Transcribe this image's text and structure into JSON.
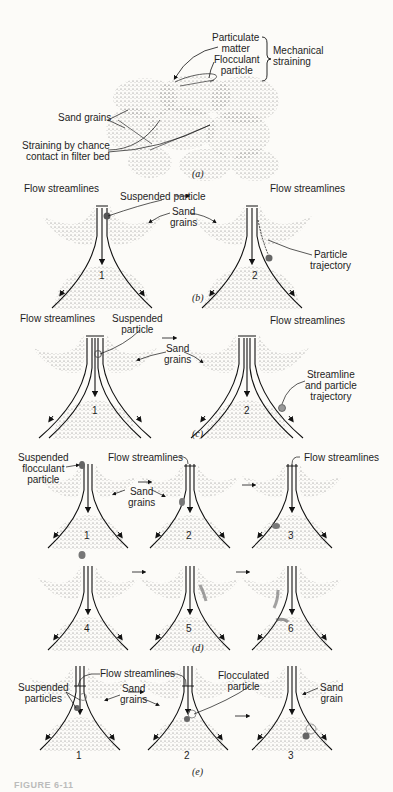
{
  "figure": {
    "caption_prefix": "FIGURE 6-11",
    "panels": {
      "a": {
        "caption": "(a)",
        "labels": {
          "particulate_matter": "Particulate\nmatter",
          "flocculant_particle": "Flocculant\nparticle",
          "mechanical_straining": "Mechanical\nstraining",
          "sand_grains": "Sand grains",
          "chance_contact": "Straining by chance\ncontact in filter bed"
        }
      },
      "b": {
        "caption": "(b)",
        "labels": {
          "flow_left": "Flow streamlines",
          "flow_right": "Flow streamlines",
          "suspended_particle": "Suspended particle",
          "sand_grains": "Sand\ngrains",
          "particle_trajectory": "Particle\ntrajectory"
        },
        "grain_numbers": [
          "1",
          "2"
        ]
      },
      "c": {
        "caption": "(c)",
        "labels": {
          "flow_left": "Flow streamlines",
          "flow_right": "Flow streamlines",
          "suspended_particle": "Suspended\nparticle",
          "sand_grains": "Sand\ngrains",
          "streamline_trajectory": "Streamline\nand particle\ntrajectory"
        },
        "grain_numbers": [
          "1",
          "2"
        ]
      },
      "d": {
        "caption": "(d)",
        "labels": {
          "suspended_flocculant": "Suspended\nflocculant\nparticle",
          "flow_mid": "Flow streamlines",
          "flow_right": "Flow streamlines",
          "sand_grains": "Sand\ngrains"
        },
        "grain_numbers": [
          "1",
          "2",
          "3",
          "4",
          "5",
          "6"
        ]
      },
      "e": {
        "caption": "(e)",
        "labels": {
          "flow": "Flow streamlines",
          "suspended_particles": "Suspended\nparticles",
          "sand_grains": "Sand\ngrains",
          "flocculated_particle": "Flocculated\nparticle",
          "sand_grain": "Sand\ngrain"
        },
        "grain_numbers": [
          "1",
          "2",
          "3"
        ]
      }
    },
    "colors": {
      "background": "#fcfbf8",
      "ink": "#1a1a1a",
      "stipple": "#8a8a8a"
    }
  }
}
